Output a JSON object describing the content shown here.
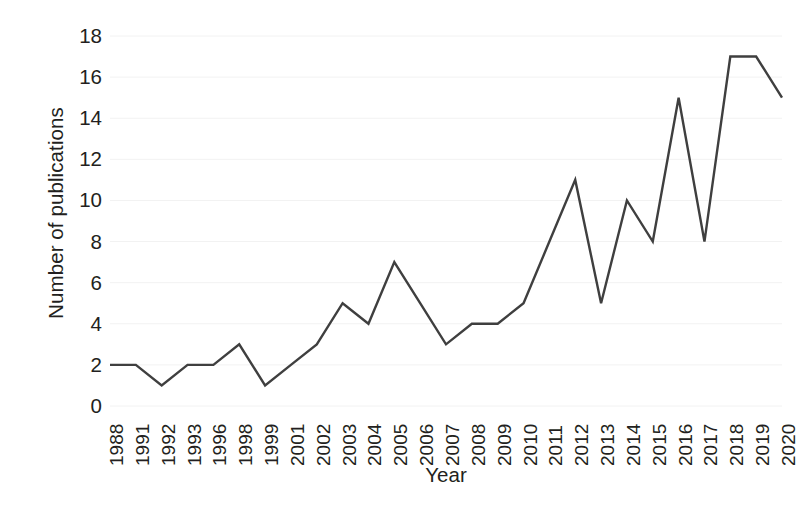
{
  "chart_data": {
    "type": "line",
    "title": "",
    "xlabel": "Year",
    "ylabel": "Number of publications",
    "categories": [
      "1988",
      "1991",
      "1992",
      "1993",
      "1996",
      "1998",
      "1999",
      "2001",
      "2002",
      "2003",
      "2004",
      "2005",
      "2006",
      "2007",
      "2008",
      "2009",
      "2010",
      "2011",
      "2012",
      "2013",
      "2014",
      "2015",
      "2016",
      "2017",
      "2018",
      "2019",
      "2020"
    ],
    "values": [
      2,
      2,
      1,
      2,
      2,
      3,
      1,
      2,
      3,
      5,
      4,
      7,
      5,
      3,
      4,
      4,
      5,
      8,
      11,
      5,
      10,
      8,
      15,
      8,
      17,
      17,
      15
    ],
    "series": [
      {
        "name": "Number of publications",
        "values": [
          2,
          2,
          1,
          2,
          2,
          3,
          1,
          2,
          3,
          5,
          4,
          7,
          5,
          3,
          4,
          4,
          5,
          8,
          11,
          5,
          10,
          8,
          15,
          8,
          17,
          17,
          15
        ]
      }
    ],
    "ylim": [
      0,
      18
    ],
    "yticks": [
      0,
      2,
      4,
      6,
      8,
      10,
      12,
      14,
      16,
      18
    ],
    "ytick_labels": [
      "0",
      "2",
      "4",
      "6",
      "8",
      "10",
      "12",
      "14",
      "16",
      "18"
    ],
    "grid": "horizontal-faint",
    "legend": "none",
    "line_color": "#3f3f3f",
    "line_width": 2.4,
    "marker": "none",
    "background_color": "#ffffff",
    "text_color": "#231f20",
    "gridline_color": "#f2f2f2"
  }
}
